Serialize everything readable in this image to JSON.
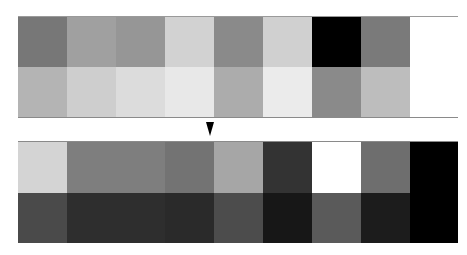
{
  "figure": {
    "columns": 9,
    "top_block": {
      "row1": [
        "#777777",
        "#a0a0a0",
        "#969696",
        "#d2d2d2",
        "#8a8a8a",
        "#d0d0d0",
        "#000000",
        "#7a7a7a",
        "#ffffff"
      ],
      "row2": [
        "#b4b4b4",
        "#cecece",
        "#dcdcdc",
        "#e8e8e8",
        "#acacac",
        "#ebebeb",
        "#8a8a8a",
        "#bdbdbd",
        "#ffffff"
      ]
    },
    "arrow": {
      "direction": "down",
      "icon": "down-arrow-icon"
    },
    "bottom_block": {
      "row1": [
        "#d4d4d4",
        "#7e7e7e",
        "#7e7e7e",
        "#737373",
        "#a6a6a6",
        "#333333",
        "#ffffff",
        "#6e6e6e",
        "#000000"
      ],
      "row2": [
        "#4a4a4a",
        "#2e2e2e",
        "#2e2e2e",
        "#2a2a2a",
        "#4c4c4c",
        "#171717",
        "#5a5a5a",
        "#1c1c1c",
        "#000000"
      ]
    },
    "column_widths": [
      49,
      49,
      49,
      49,
      49,
      49,
      49,
      49,
      48
    ]
  }
}
